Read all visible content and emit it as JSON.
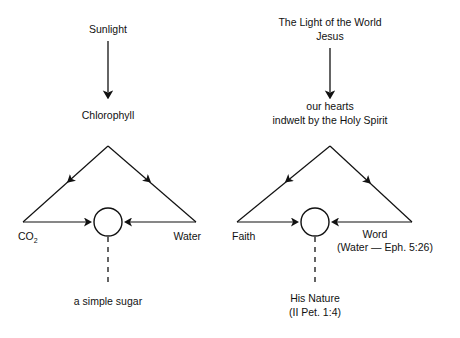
{
  "figure": {
    "title": "",
    "background_color": "#ffffff",
    "line_color": "#111111",
    "panels": [
      {
        "id": "photosynthesis",
        "source_label": "Sunlight",
        "agent_label": "Chlorophyll",
        "agent_label_line2": "",
        "left_input": "CO",
        "left_input_subscript": "2",
        "right_input": "Water",
        "right_input_note": "",
        "output_line1": "a simple sugar",
        "output_line2": ""
      },
      {
        "id": "spiritual",
        "source_label": "The Light of the World",
        "source_label_line2": "Jesus",
        "agent_label": "our hearts",
        "agent_label_line2": "indwelt by the Holy Spirit",
        "left_input": "Faith",
        "left_input_subscript": "",
        "right_input": "Word",
        "right_input_note": "(Water — Eph. 5:26)",
        "output_line1": "His Nature",
        "output_line2": "(II Pet. 1:4)"
      }
    ]
  }
}
